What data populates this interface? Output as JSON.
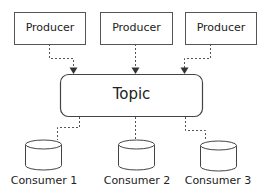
{
  "diagram": {
    "producers": [
      {
        "label": "Producer"
      },
      {
        "label": "Producer"
      },
      {
        "label": "Producer"
      }
    ],
    "topic": {
      "label": "Topic"
    },
    "consumers": [
      {
        "label": "Consumer 1"
      },
      {
        "label": "Consumer 2"
      },
      {
        "label": "Consumer 3"
      }
    ],
    "colors": {
      "stroke": "#555555",
      "text": "#222222",
      "background": "#ffffff"
    }
  }
}
